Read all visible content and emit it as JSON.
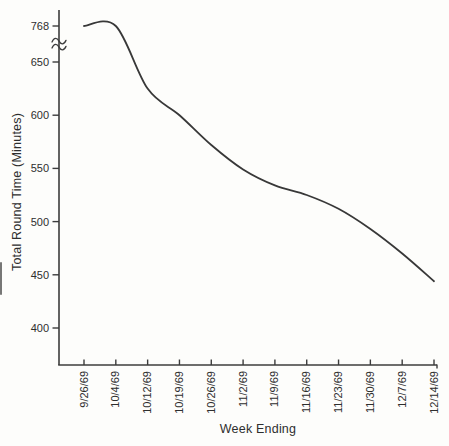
{
  "chart_data": {
    "type": "line",
    "title": "",
    "xlabel": "Week Ending",
    "ylabel": "Total Round Time (Minutes)",
    "categories": [
      "9/26/69",
      "10/4/69",
      "10/12/69",
      "10/19/69",
      "10/26/69",
      "11/2/69",
      "11/9/69",
      "11/16/69",
      "11/23/69",
      "11/30/69",
      "12/7/69",
      "12/14/69"
    ],
    "series": [
      {
        "name": "Total round time",
        "values": [
          768,
          660,
          625,
          600,
          572,
          549,
          534,
          525,
          512,
          493,
          470,
          444
        ]
      }
    ],
    "y_ticks": [
      768,
      650,
      600,
      550,
      500,
      450,
      400
    ],
    "axis_break": {
      "present": true,
      "between": [
        650,
        768
      ],
      "symbol": "double-tilde"
    },
    "ylim": [
      400,
      768
    ],
    "grid": false,
    "legend": false,
    "line_color": "#383838",
    "axis_color": "#3c3c3c",
    "text_color": "#2e2e2e",
    "background": "#fdfdfb"
  }
}
